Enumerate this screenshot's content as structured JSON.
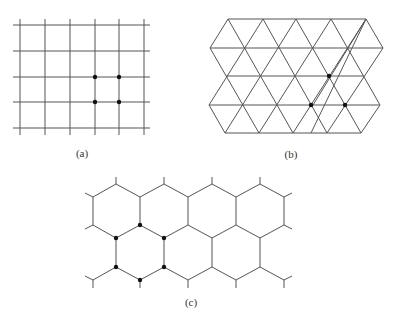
{
  "figure": {
    "panels": [
      {
        "id": "a",
        "label": "(a)",
        "type": "square-lattice",
        "rows": 5,
        "cols": 6,
        "highlighted_points": 4
      },
      {
        "id": "b",
        "label": "(b)",
        "type": "triangular-lattice",
        "rows": 5,
        "highlighted_points": 3
      },
      {
        "id": "c",
        "label": "(c)",
        "type": "hexagonal-lattice",
        "highlighted_points": 6
      }
    ],
    "colors": {
      "line": "#555555",
      "dot": "#111111",
      "background": "#ffffff"
    }
  }
}
